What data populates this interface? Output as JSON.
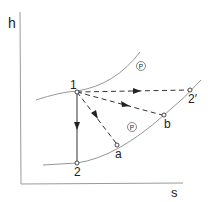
{
  "diagram": {
    "type": "Mollier h-s diagram (enthalpy-entropy)",
    "axes": {
      "y_label": "h",
      "x_label": "s"
    },
    "isobars": [
      {
        "label": "P",
        "position": "upper",
        "description": "higher-pressure isobar through point 1"
      },
      {
        "label": "P",
        "position": "lower",
        "description": "lower-pressure isobar through points 2, a, b"
      }
    ],
    "points": [
      {
        "id": "1",
        "label": "1",
        "on": "upper isobar"
      },
      {
        "id": "2",
        "label": "2",
        "on": "lower isobar"
      },
      {
        "id": "a",
        "label": "a",
        "on": "lower isobar"
      },
      {
        "id": "b",
        "label": "b",
        "on": "lower isobar"
      },
      {
        "id": "2p",
        "label": "2′",
        "on": "upper isobar"
      }
    ],
    "processes": [
      {
        "from": "1",
        "to": "2",
        "style": "solid",
        "arrow": true,
        "meaning": "isentropic (vertical)"
      },
      {
        "from": "1",
        "to": "a",
        "style": "dashed",
        "arrow": true
      },
      {
        "from": "1",
        "to": "b",
        "style": "dashed",
        "arrow": true
      },
      {
        "from": "1",
        "to": "2′",
        "style": "dashed",
        "arrow": true,
        "meaning": "isenthalpic (horizontal)"
      }
    ]
  },
  "colors": {
    "background": "#ffffff",
    "curve": "#8a8a8a",
    "line": "#333333",
    "axis": "#9a9a9a"
  }
}
